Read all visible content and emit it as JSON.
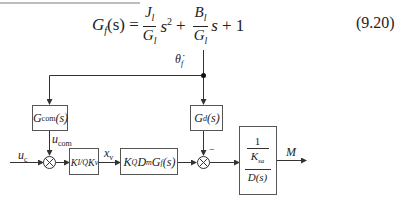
{
  "equation": {
    "lhs": "G",
    "lhs_sub": "f",
    "lhs_arg": "(s) =",
    "term1_num": "J",
    "term1_num_sub": "l",
    "term1_den": "G",
    "term1_den_sub": "l",
    "term1_var": "s",
    "term1_pow": "2",
    "plus1": "+",
    "term2_num": "B",
    "term2_num_sub": "l",
    "term2_den": "G",
    "term2_den_sub": "l",
    "term2_var": "s",
    "plus2": "+ 1",
    "number": "(9.20)"
  },
  "diagram": {
    "signals": {
      "theta_dot": "θ̇",
      "theta_sub": "f",
      "uc": "u",
      "uc_sub": "c",
      "ucom": "u",
      "ucom_sub": "com",
      "xv": "x",
      "xv_sub": "v",
      "minus": "−",
      "output": "M"
    },
    "blocks": {
      "gcom": {
        "main": "G",
        "sub": "com",
        "arg": "(s)"
      },
      "gain": {
        "k1": "K",
        "k1_sub": "I/Q",
        "k2": "K",
        "k2_sub": "v"
      },
      "plant": {
        "k": "K",
        "k_sub": "Q",
        "d": "D",
        "d_sub": "m",
        "g": "G",
        "g_sub": "f",
        "arg": "(s)"
      },
      "gd": {
        "main": "G",
        "sub": "d",
        "arg": "(s)"
      },
      "output_block": {
        "numerator": "1",
        "mid": "K",
        "mid_sub": "sa",
        "den": "D(s)"
      }
    },
    "colors": {
      "line": "#333333",
      "box_border": "#555555"
    }
  }
}
